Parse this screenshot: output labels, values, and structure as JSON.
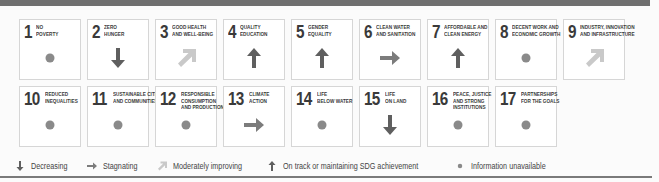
{
  "colors": {
    "dark": "#5f5f5f",
    "light": "#c9c9c9",
    "dot": "#8a8a8a"
  },
  "goals": [
    {
      "number": "1",
      "label": "NO\nPOVERTY",
      "status": "info-unavailable"
    },
    {
      "number": "2",
      "label": "ZERO\nHUNGER",
      "status": "decreasing"
    },
    {
      "number": "3",
      "label": "GOOD HEALTH\nAND WELL-BEING",
      "status": "moderately-improving"
    },
    {
      "number": "4",
      "label": "QUALITY\nEDUCATION",
      "status": "on-track"
    },
    {
      "number": "5",
      "label": "GENDER\nEQUALITY",
      "status": "on-track"
    },
    {
      "number": "6",
      "label": "CLEAN WATER\nAND SANITATION",
      "status": "stagnating"
    },
    {
      "number": "7",
      "label": "AFFORDABLE AND\nCLEAN ENERGY",
      "status": "on-track"
    },
    {
      "number": "8",
      "label": "DECENT WORK AND\nECONOMIC GROWTH",
      "status": "info-unavailable"
    },
    {
      "number": "9",
      "label": "INDUSTRY, INNOVATION\nAND INFRASTRUCTURE",
      "status": "moderately-improving"
    },
    {
      "number": "10",
      "label": "REDUCED\nINEQUALITIES",
      "status": "info-unavailable"
    },
    {
      "number": "11",
      "label": "SUSTAINABLE CITIES\nAND COMMUNITIES",
      "status": "info-unavailable"
    },
    {
      "number": "12",
      "label": "RESPONSIBLE\nCONSUMPTION\nAND PRODUCTION",
      "status": "info-unavailable"
    },
    {
      "number": "13",
      "label": "CLIMATE\nACTION",
      "status": "stagnating"
    },
    {
      "number": "14",
      "label": "LIFE\nBELOW WATER",
      "status": "info-unavailable"
    },
    {
      "number": "15",
      "label": "LIFE\nON LAND",
      "status": "decreasing"
    },
    {
      "number": "16",
      "label": "PEACE, JUSTICE\nAND STRONG\nINSTITUTIONS",
      "status": "info-unavailable"
    },
    {
      "number": "17",
      "label": "PARTNERSHIPS\nFOR THE GOALS",
      "status": "info-unavailable"
    }
  ],
  "legend": [
    {
      "icon": "decreasing",
      "label": "Decreasing"
    },
    {
      "icon": "stagnating",
      "label": "Stagnating"
    },
    {
      "icon": "moderately-improving",
      "label": "Moderately improving"
    },
    {
      "icon": "on-track",
      "label": "On track or maintaining SDG achievement"
    },
    {
      "icon": "info-unavailable",
      "label": "Information unavailable"
    }
  ]
}
